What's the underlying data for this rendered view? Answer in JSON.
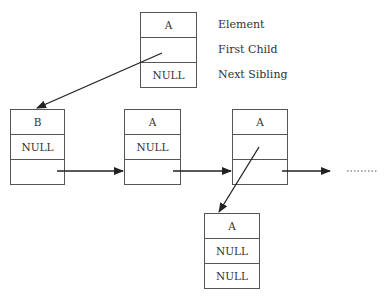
{
  "diagram": {
    "type": "first-child-next-sibling tree representation",
    "legend_node": {
      "cells": [
        "A",
        "",
        "NULL"
      ],
      "labels": [
        "Element",
        "First Child",
        "Next Sibling"
      ]
    },
    "nodes": [
      {
        "id": "root",
        "cells": [
          "A",
          "",
          "NULL"
        ]
      },
      {
        "id": "child-b",
        "cells": [
          "B",
          "NULL",
          ""
        ]
      },
      {
        "id": "child-a1",
        "cells": [
          "A",
          "NULL",
          ""
        ]
      },
      {
        "id": "child-a2",
        "cells": [
          "A",
          "",
          ""
        ]
      },
      {
        "id": "grandchild-a",
        "cells": [
          "A",
          "NULL",
          "NULL"
        ]
      }
    ],
    "edges": [
      {
        "from": "root",
        "field": "First Child",
        "to": "child-b"
      },
      {
        "from": "child-b",
        "field": "Next Sibling",
        "to": "child-a1"
      },
      {
        "from": "child-a1",
        "field": "Next Sibling",
        "to": "child-a2"
      },
      {
        "from": "child-a2",
        "field": "Next Sibling",
        "to": "more"
      },
      {
        "from": "child-a2",
        "field": "First Child",
        "to": "grandchild-a"
      }
    ],
    "continuation": "........"
  }
}
